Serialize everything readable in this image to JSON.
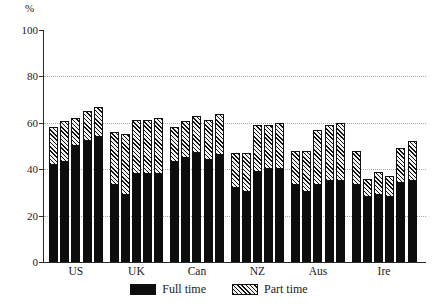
{
  "chart_data": {
    "type": "bar",
    "subtype": "stacked-grouped",
    "title": "",
    "xlabel": "",
    "ylabel": "%",
    "ylim": [
      0,
      100
    ],
    "yticks": [
      0,
      20,
      40,
      60,
      80,
      100
    ],
    "grid": true,
    "gridlines_at": [
      20,
      40,
      60,
      80
    ],
    "legend_position": "bottom-center",
    "categories": [
      "US",
      "UK",
      "Can",
      "NZ",
      "Aus",
      "Ire"
    ],
    "series": [
      {
        "name": "Full time",
        "style": "solid-black",
        "color": "#0d0d0d",
        "values": [
          [
            42,
            43,
            50,
            52,
            54
          ],
          [
            33,
            29,
            38,
            38,
            38
          ],
          [
            43,
            45,
            47,
            44,
            46
          ],
          [
            32,
            30,
            39,
            40,
            40
          ],
          [
            33,
            30,
            33,
            35,
            35
          ],
          [
            33,
            28,
            29,
            28,
            34,
            35
          ]
        ]
      },
      {
        "name": "Part time",
        "style": "hatched",
        "color": "#f2f2f2",
        "values": [
          [
            16,
            18,
            12,
            13,
            13
          ],
          [
            23,
            26,
            23,
            23,
            24
          ],
          [
            15,
            16,
            16,
            17,
            18
          ],
          [
            15,
            17,
            20,
            19,
            20
          ],
          [
            15,
            18,
            24,
            24,
            25
          ],
          [
            15,
            8,
            10,
            9,
            15,
            17
          ]
        ]
      }
    ],
    "totals": [
      [
        58,
        61,
        62,
        65,
        67
      ],
      [
        56,
        55,
        61,
        61,
        62
      ],
      [
        58,
        61,
        63,
        61,
        64
      ],
      [
        47,
        47,
        59,
        59,
        60
      ],
      [
        48,
        48,
        57,
        59,
        59
      ],
      [
        48,
        36,
        39,
        37,
        49,
        52
      ]
    ],
    "bars_per_group": [
      5,
      5,
      5,
      5,
      5,
      6
    ],
    "legend": [
      {
        "label": "Full time",
        "swatch": "solid-black-swatch"
      },
      {
        "label": "Part time",
        "swatch": "hatched-swatch"
      }
    ],
    "axis": {
      "y_unit": "%",
      "y_tick_labels": [
        "0",
        "20",
        "40",
        "60",
        "80",
        "100"
      ]
    }
  }
}
